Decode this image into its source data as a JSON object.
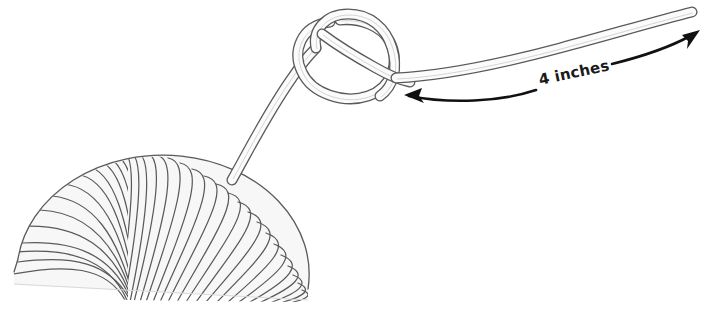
{
  "figure": {
    "alt_description": "A half-dome ball of yarn with a strand extending up and to the right, forming an overhand knot, with a free end labeled 4 inches",
    "background_color": "#ffffff"
  },
  "annotations": {
    "dimension_label": "4 inches",
    "dimension_value": 4,
    "dimension_unit": "inches",
    "label_rotation_degrees": -12,
    "arrow_style": "double-headed curved",
    "label_color": "#1a1a1a"
  },
  "objects": {
    "yarn_ball": {
      "name": "ball of yarn",
      "shape": "half-dome",
      "fill_color": "#f7f7f7",
      "stroke_color": "#555555",
      "strand_count_left_fan": 16,
      "strand_count_right_fan": 22
    },
    "rope": {
      "name": "yarn strand",
      "fill_color": "#fbfbfb",
      "stroke_color": "#555555",
      "inner_line_color": "#cccccc",
      "end_cap": "rounded"
    },
    "knot": {
      "name": "overhand knot",
      "type": "loop with crossing strands"
    }
  },
  "icons": {
    "arrow_left": "arrow-left-icon",
    "arrow_right": "arrow-right-icon"
  }
}
